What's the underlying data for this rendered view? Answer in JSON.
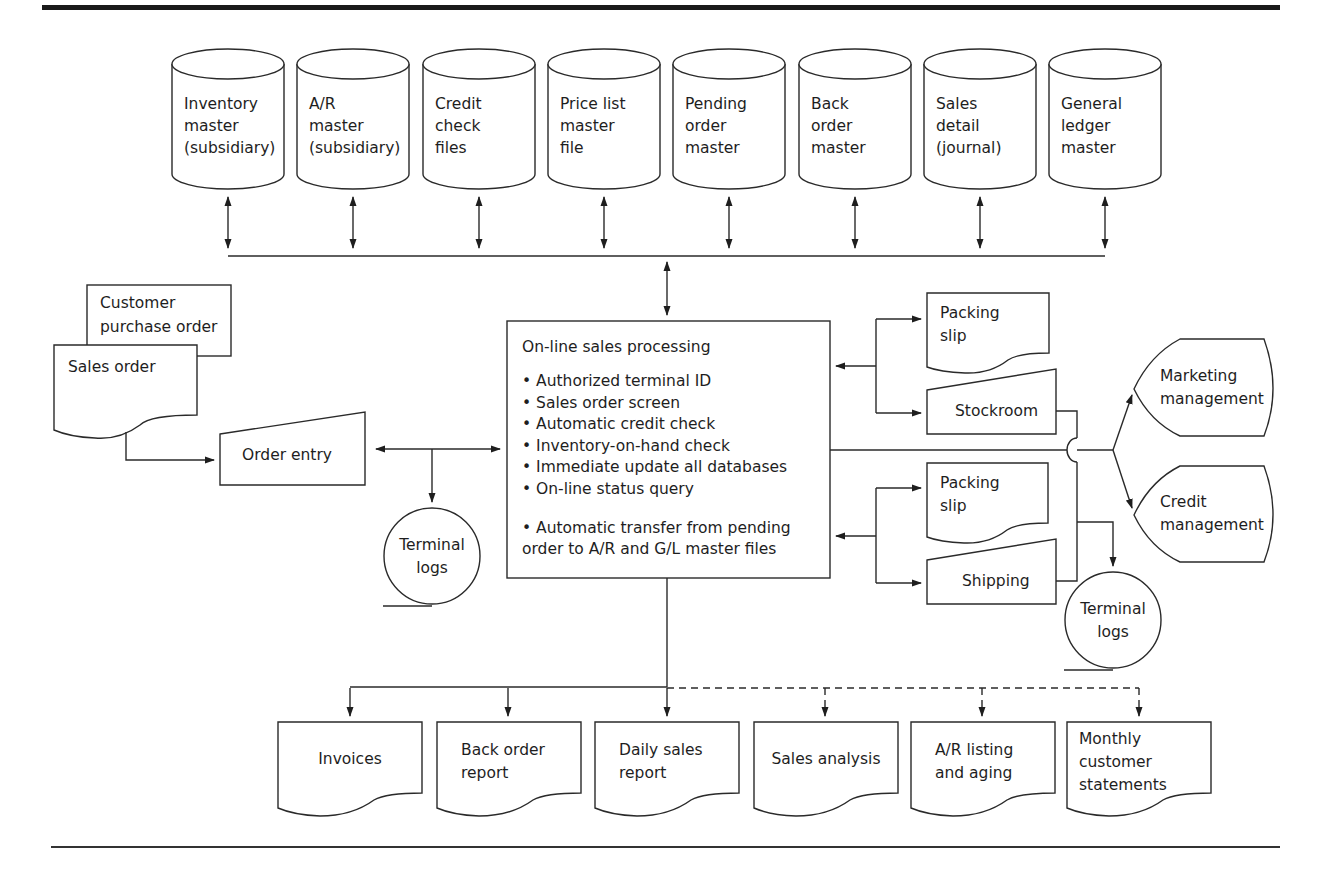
{
  "diagram": {
    "type": "system-flowchart",
    "databases": [
      {
        "lines": [
          "Inventory",
          "master",
          "(subsidiary)"
        ]
      },
      {
        "lines": [
          "A/R",
          "master",
          "(subsidiary)"
        ]
      },
      {
        "lines": [
          "Credit",
          "check",
          "files"
        ]
      },
      {
        "lines": [
          "Price list",
          "master",
          "file"
        ]
      },
      {
        "lines": [
          "Pending",
          "order",
          "master"
        ]
      },
      {
        "lines": [
          "Back",
          "order",
          "master"
        ]
      },
      {
        "lines": [
          "Sales",
          "detail",
          "(journal)"
        ]
      },
      {
        "lines": [
          "General",
          "ledger",
          "master"
        ]
      }
    ],
    "inputs": {
      "customer_po": {
        "lines": [
          "Customer",
          "purchase order"
        ]
      },
      "sales_order": {
        "lines": [
          "Sales order"
        ]
      },
      "order_entry": {
        "label": "Order entry"
      },
      "terminal_logs_left": {
        "lines": [
          "Terminal",
          "logs"
        ]
      }
    },
    "process": {
      "title": "On-line sales processing",
      "bullets": [
        "Authorized terminal ID",
        "Sales order screen",
        "Automatic credit check",
        "Inventory-on-hand check",
        "Immediate update all databases",
        "On-line status query"
      ],
      "bullet_extra": [
        "Automatic transfer from pending",
        "order to A/R and G/L master files"
      ],
      "bullet_char": "•"
    },
    "outputs_right": {
      "packing_slip_1": {
        "lines": [
          "Packing",
          "slip"
        ]
      },
      "stockroom": {
        "label": "Stockroom"
      },
      "packing_slip_2": {
        "lines": [
          "Packing",
          "slip"
        ]
      },
      "shipping": {
        "label": "Shipping"
      },
      "terminal_logs_right": {
        "lines": [
          "Terminal",
          "logs"
        ]
      },
      "marketing": {
        "lines": [
          "Marketing",
          "management"
        ]
      },
      "credit": {
        "lines": [
          "Credit",
          "management"
        ]
      }
    },
    "reports": [
      {
        "lines": [
          "Invoices"
        ],
        "link": "solid"
      },
      {
        "lines": [
          "Back order",
          "report"
        ],
        "link": "solid"
      },
      {
        "lines": [
          "Daily sales",
          "report"
        ],
        "link": "solid"
      },
      {
        "lines": [
          "Sales analysis"
        ],
        "link": "dashed"
      },
      {
        "lines": [
          "A/R listing",
          "and aging"
        ],
        "link": "dashed"
      },
      {
        "lines": [
          "Monthly",
          "customer",
          "statements"
        ],
        "link": "dashed"
      }
    ]
  }
}
